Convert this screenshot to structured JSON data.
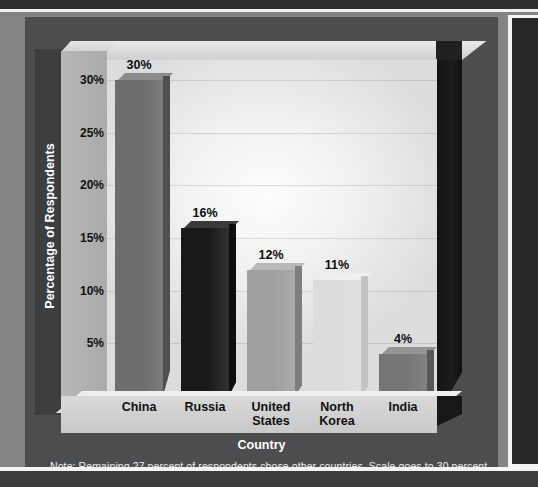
{
  "chart_data": {
    "type": "bar",
    "title": "",
    "xlabel": "Country",
    "ylabel": "Percentage of Respondents",
    "categories": [
      "China",
      "Russia",
      "United States",
      "North Korea",
      "India"
    ],
    "values": [
      30,
      16,
      12,
      11,
      4
    ],
    "value_labels": [
      "30%",
      "16%",
      "12%",
      "11%",
      "4%"
    ],
    "ylim": [
      0,
      32
    ],
    "ytick_values": [
      0,
      5,
      10,
      15,
      20,
      25,
      30
    ],
    "ytick_labels": [
      "0%",
      "5%",
      "10%",
      "15%",
      "20%",
      "25%",
      "30%"
    ],
    "grid": true,
    "legend": "none",
    "style": "3d-bar",
    "bar_colors": [
      "#6d6d6d",
      "#19191b",
      "#a0a0a0",
      "#dcdcdc",
      "#757575"
    ],
    "bar_top_colors": [
      "#8c8c8c",
      "#3a3a3c",
      "#b8b8b8",
      "#efefef",
      "#949494"
    ],
    "bar_side_colors": [
      "#4f4f4f",
      "#0d0d0e",
      "#7e7e7e",
      "#c2c2c2",
      "#585858"
    ]
  },
  "note": {
    "text": "Note: Remaining 27 percent of respondents chose other countries. Scale goes to 30 percent."
  },
  "axes": {
    "y_title": "Percentage of Respondents",
    "x_title": "Country"
  },
  "colors": {
    "page_background": "#848484",
    "frame": "#4c4d4f",
    "plot_background": "#f0f0f0",
    "axis_slab": "#b0b0b0",
    "dark_band": "#3b3c3e",
    "rule": "#f2f2f2",
    "text_dark": "#111111",
    "text_light": "#ffffff"
  }
}
